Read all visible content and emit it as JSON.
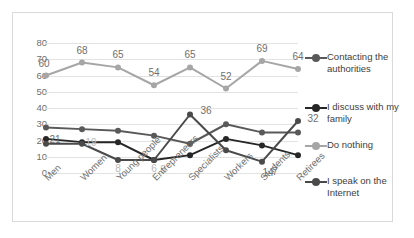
{
  "chart_data": {
    "type": "line",
    "title": "",
    "xlabel": "",
    "ylabel": "",
    "ylim": [
      0,
      80
    ],
    "ytick_step": 10,
    "yticks": [
      80,
      70,
      60,
      50,
      40,
      30,
      20,
      10,
      0
    ],
    "grid": true,
    "legend_position": "right",
    "categories": [
      "Men",
      "Women",
      "Young people",
      "Entrepreneurs",
      "Specialists",
      "Workers",
      "Students",
      "Retirees"
    ],
    "series": [
      {
        "name": "Contacting the authorities",
        "color": "#595959",
        "values": [
          28,
          27,
          26,
          23,
          18,
          30,
          25,
          25
        ],
        "labels": [
          "",
          "",
          "",
          "",
          "",
          "",
          "",
          ""
        ]
      },
      {
        "name": "I discuss with my family",
        "color": "#262626",
        "values": [
          21,
          19,
          19,
          8,
          11,
          21,
          17,
          11
        ],
        "labels": [
          "21",
          "19",
          "",
          "8",
          "",
          "",
          "",
          ""
        ]
      },
      {
        "name": "Do nothing",
        "color": "#a6a6a6",
        "values": [
          60,
          68,
          65,
          54,
          65,
          52,
          69,
          64
        ],
        "labels": [
          "60",
          "68",
          "65",
          "54",
          "65",
          "52",
          "69",
          "64"
        ]
      },
      {
        "name": "I speak on the Internet",
        "color": "#4a4a4a",
        "values": [
          18,
          18,
          8,
          8,
          36,
          14,
          7,
          32
        ],
        "labels": [
          "",
          "",
          "8",
          "6",
          "36",
          "",
          "14",
          "32"
        ]
      }
    ],
    "annotations": [
      {
        "text": "7",
        "series": "I speak on the Internet",
        "category": "Students"
      }
    ]
  },
  "legend": {
    "items": [
      {
        "label": "Contacting the\nauthorities",
        "color": "#595959"
      },
      {
        "label": "I discuss with my\nfamily",
        "color": "#262626"
      },
      {
        "label": "Do nothing",
        "color": "#a6a6a6"
      },
      {
        "label": "I speak on the\nInternet",
        "color": "#4a4a4a"
      }
    ]
  },
  "colors": {
    "gridline": "#e3e3e3",
    "axis_text": "#6f6f6f",
    "frame_border": "#d9d9d9",
    "background": "#ffffff"
  }
}
